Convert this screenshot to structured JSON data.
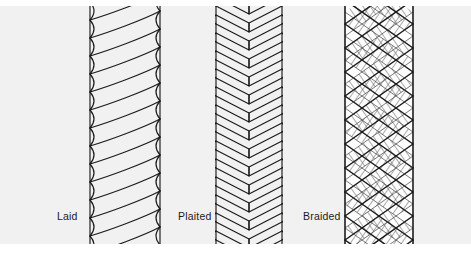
{
  "figure": {
    "background_color": "#ffffff",
    "panel_color": "#f1f1f1",
    "line_color": "#1b1b1b",
    "label_color": "#1b1b1b"
  },
  "ropes": [
    {
      "id": "laid",
      "label": "Laid",
      "construction": "three-strand helical twist",
      "strand_count": 3
    },
    {
      "id": "plaited",
      "label": "Plaited",
      "construction": "flat chevron herringbone braid",
      "strand_count": 8
    },
    {
      "id": "braided",
      "label": "Braided",
      "construction": "diamond lattice braid over core, hatched shading",
      "strand_count": 16
    }
  ]
}
